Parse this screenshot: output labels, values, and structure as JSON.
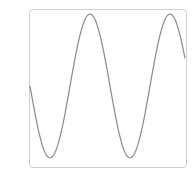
{
  "panel": {
    "label": ")"
  },
  "chart_data": {
    "type": "line",
    "title": "",
    "xlabel": "",
    "ylabel": "",
    "grid": false,
    "legend": null,
    "series": [
      {
        "name": "sine",
        "color": "#8a8a8a",
        "x": [
          0,
          0.125,
          0.25,
          0.375,
          0.5,
          0.625,
          0.75,
          0.875,
          1.0,
          1.125,
          1.25,
          1.375,
          1.5,
          1.625,
          1.75
        ],
        "values": [
          0,
          -0.71,
          -1,
          -0.71,
          0,
          0.71,
          1,
          0.71,
          0,
          -0.71,
          -1,
          -0.71,
          0,
          0.71,
          1
        ]
      }
    ],
    "ylim": [
      -1,
      1
    ]
  }
}
